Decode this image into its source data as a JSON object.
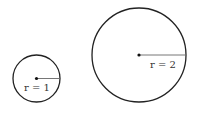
{
  "diagram": {
    "circles": [
      {
        "id": "small",
        "cx": 36.5,
        "cy": 78.5,
        "r": 23.5,
        "label": "r = 1",
        "label_x": 24,
        "label_y": 91
      },
      {
        "id": "large",
        "cx": 139,
        "cy": 55,
        "r": 47,
        "label": "r = 2",
        "label_x": 150,
        "label_y": 68
      }
    ],
    "stroke_color": "#222222",
    "radius_line_color": "#666666",
    "center_dot_color": "#111111"
  }
}
